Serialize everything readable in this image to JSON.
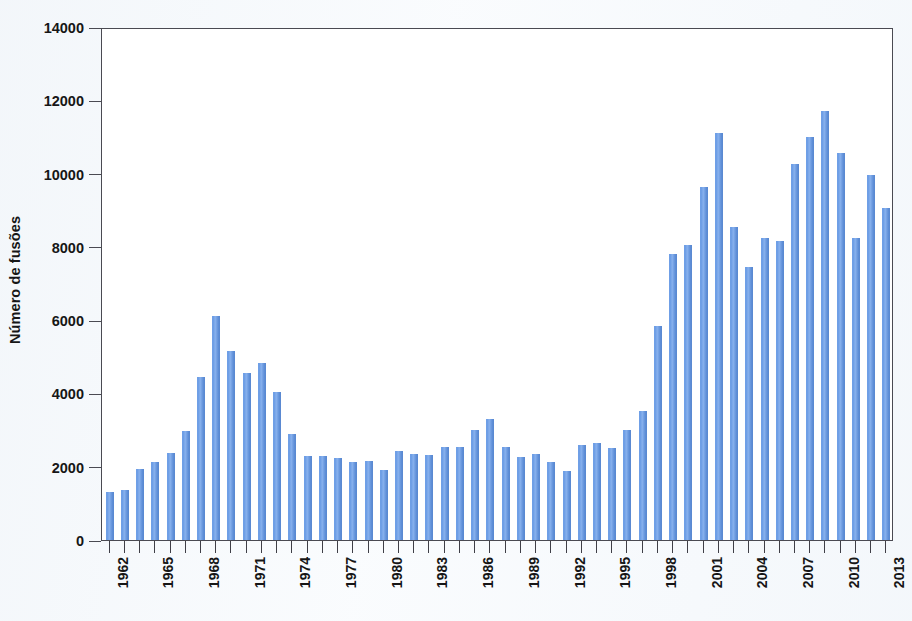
{
  "chart_data": {
    "type": "bar",
    "title": "",
    "subtitle": "",
    "xlabel": "",
    "ylabel": "Número de fusões",
    "ylim": [
      0,
      14000
    ],
    "ytick_values": [
      0,
      2000,
      4000,
      6000,
      8000,
      10000,
      12000,
      14000
    ],
    "ytick_labels": [
      "0",
      "2000",
      "4000",
      "6000",
      "8000",
      "10000",
      "12000",
      "14000"
    ],
    "grid": false,
    "legend": null,
    "bar_color": "#6f9fe6",
    "xtick_labels": [
      "1962",
      "1965",
      "1968",
      "1971",
      "1974",
      "1977",
      "1980",
      "1983",
      "1986",
      "1989",
      "1992",
      "1995",
      "1998",
      "2001",
      "2004",
      "2007",
      "2010",
      "2013"
    ],
    "xtick_every": 3,
    "categories": [
      "1962",
      "1963",
      "1964",
      "1965",
      "1966",
      "1967",
      "1968",
      "1969",
      "1970",
      "1971",
      "1972",
      "1973",
      "1974",
      "1975",
      "1976",
      "1977",
      "1978",
      "1979",
      "1980",
      "1981",
      "1982",
      "1983",
      "1984",
      "1985",
      "1986",
      "1987",
      "1988",
      "1989",
      "1990",
      "1991",
      "1992",
      "1993",
      "1994",
      "1995",
      "1996",
      "1997",
      "1998",
      "1999",
      "2000",
      "2001",
      "2002",
      "2003",
      "2004",
      "2005",
      "2006",
      "2007",
      "2008",
      "2009",
      "2010",
      "2011",
      "2012",
      "2013"
    ],
    "values": [
      1300,
      1360,
      1950,
      2130,
      2380,
      2980,
      4460,
      6110,
      5150,
      4570,
      4830,
      4040,
      2880,
      2300,
      2280,
      2240,
      2140,
      2150,
      1900,
      2420,
      2350,
      2330,
      2550,
      2550,
      3000,
      3310,
      2540,
      2270,
      2350,
      2130,
      1880,
      2580,
      2650,
      2500,
      3000,
      3510,
      5850,
      7810,
      8040,
      9640,
      11100,
      8550,
      7450,
      8250,
      8150,
      10250,
      11000,
      11700,
      10550,
      8250,
      9950,
      9070
    ]
  }
}
